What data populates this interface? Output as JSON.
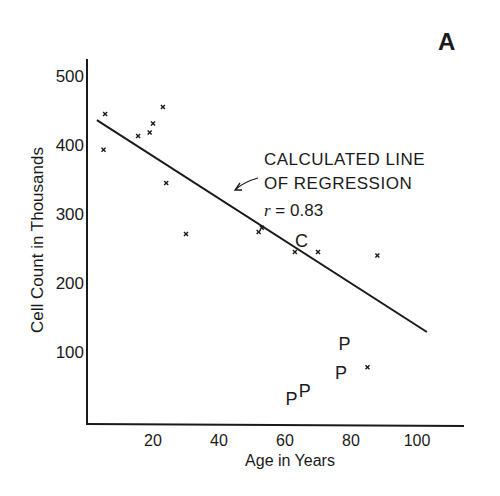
{
  "panel_label": "A",
  "chart_data": {
    "type": "scatter",
    "title": "",
    "xlabel": "Age in Years",
    "ylabel": "Cell Count in Thousands",
    "xlim": [
      0,
      110
    ],
    "ylim": [
      0,
      520
    ],
    "x_ticks": [
      20,
      40,
      60,
      80,
      100
    ],
    "y_ticks": [
      100,
      200,
      300,
      400,
      500
    ],
    "grid": false,
    "legend": null,
    "series": [
      {
        "name": "Normal (x)",
        "marker": "x",
        "points": [
          {
            "x": 5.5,
            "y": 445
          },
          {
            "x": 5,
            "y": 393
          },
          {
            "x": 15.5,
            "y": 413
          },
          {
            "x": 19,
            "y": 418
          },
          {
            "x": 20,
            "y": 431
          },
          {
            "x": 23,
            "y": 455
          },
          {
            "x": 24,
            "y": 345
          },
          {
            "x": 30,
            "y": 271
          },
          {
            "x": 52,
            "y": 274
          },
          {
            "x": 53,
            "y": 280
          },
          {
            "x": 63,
            "y": 245
          },
          {
            "x": 70,
            "y": 245
          },
          {
            "x": 88,
            "y": 240
          },
          {
            "x": 85,
            "y": 78
          }
        ]
      },
      {
        "name": "P",
        "marker": "P",
        "points": [
          {
            "x": 62,
            "y": 33
          },
          {
            "x": 66,
            "y": 45
          },
          {
            "x": 77,
            "y": 71
          },
          {
            "x": 78,
            "y": 113
          }
        ]
      },
      {
        "name": "C",
        "marker": "C",
        "points": [
          {
            "x": 65,
            "y": 262
          }
        ]
      }
    ],
    "regression_line": {
      "x1": 3,
      "y1": 436,
      "x2": 103,
      "y2": 129
    },
    "annotations": [
      {
        "text_line1": "CALCULATED LINE",
        "text_line2": "OF REGRESSION",
        "r_label": "r",
        "r_value": "= 0.83",
        "arrow_to": {
          "x": 45,
          "y": 340
        }
      }
    ]
  }
}
